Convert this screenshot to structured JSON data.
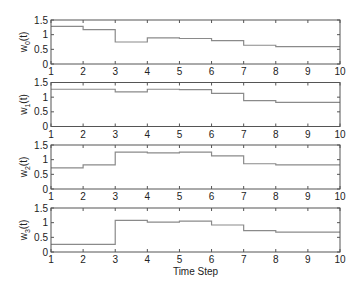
{
  "chart_data": {
    "type": "line",
    "subtype": "step",
    "xlabel": "Time Step",
    "x_ticks": [
      1,
      2,
      3,
      4,
      5,
      6,
      7,
      8,
      9,
      10
    ],
    "xlim": [
      1,
      10
    ],
    "panels": [
      {
        "ylabel": "w",
        "ylabel_sub": "0",
        "ylabel_suffix": "(t)",
        "ylim": [
          0,
          1.5
        ],
        "y_ticks": [
          0,
          0.5,
          1,
          1.5
        ],
        "x": [
          1,
          2,
          3,
          4,
          5,
          6,
          7,
          8,
          9,
          10
        ],
        "values": [
          1.28,
          1.17,
          0.75,
          0.89,
          0.87,
          0.8,
          0.64,
          0.59,
          0.59
        ]
      },
      {
        "ylabel": "w",
        "ylabel_sub": "1",
        "ylabel_suffix": "(t)",
        "ylim": [
          0,
          1.5
        ],
        "y_ticks": [
          0,
          0.5,
          1,
          1.5
        ],
        "x": [
          1,
          2,
          3,
          4,
          5,
          6,
          7,
          8,
          9,
          10
        ],
        "values": [
          1.27,
          1.27,
          1.18,
          1.27,
          1.26,
          1.13,
          0.88,
          0.82,
          0.82
        ]
      },
      {
        "ylabel": "w",
        "ylabel_sub": "2",
        "ylabel_suffix": "(t)",
        "ylim": [
          0,
          1.5
        ],
        "y_ticks": [
          0,
          0.5,
          1,
          1.5
        ],
        "x": [
          1,
          2,
          3,
          4,
          5,
          6,
          7,
          8,
          9,
          10
        ],
        "values": [
          0.72,
          0.82,
          1.26,
          1.23,
          1.26,
          1.13,
          0.86,
          0.82,
          0.82
        ]
      },
      {
        "ylabel": "w",
        "ylabel_sub": "3",
        "ylabel_suffix": "(t)",
        "ylim": [
          0,
          1.5
        ],
        "y_ticks": [
          0,
          0.5,
          1,
          1.5
        ],
        "x": [
          1,
          2,
          3,
          4,
          5,
          6,
          7,
          8,
          9,
          10
        ],
        "values": [
          0.26,
          0.26,
          1.08,
          1.02,
          1.05,
          0.92,
          0.73,
          0.68,
          0.68
        ]
      }
    ],
    "grid": false,
    "legend": null
  },
  "colors": {
    "line": "#8a8a8a",
    "axes": "#555555",
    "text": "#222222"
  }
}
